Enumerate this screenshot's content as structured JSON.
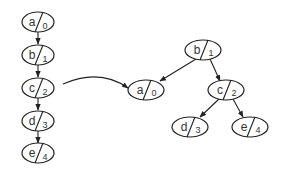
{
  "diagram": {
    "type": "linked-list-to-binary-tree",
    "left_chain": {
      "nodes": [
        {
          "label": "a",
          "index": "0"
        },
        {
          "label": "b",
          "index": "1"
        },
        {
          "label": "c",
          "index": "2"
        },
        {
          "label": "d",
          "index": "3"
        },
        {
          "label": "e",
          "index": "4"
        }
      ],
      "edges": [
        [
          "a",
          "b"
        ],
        [
          "b",
          "c"
        ],
        [
          "c",
          "d"
        ],
        [
          "d",
          "e"
        ]
      ]
    },
    "transform_arrow": {
      "from": "left_chain.c",
      "to": "right_tree.a"
    },
    "right_tree": {
      "nodes": [
        {
          "label": "b",
          "index": "1"
        },
        {
          "label": "a",
          "index": "0"
        },
        {
          "label": "c",
          "index": "2"
        },
        {
          "label": "d",
          "index": "3"
        },
        {
          "label": "e",
          "index": "4"
        }
      ],
      "edges": [
        [
          "b",
          "a"
        ],
        [
          "b",
          "c"
        ],
        [
          "c",
          "d"
        ],
        [
          "c",
          "e"
        ]
      ]
    }
  }
}
